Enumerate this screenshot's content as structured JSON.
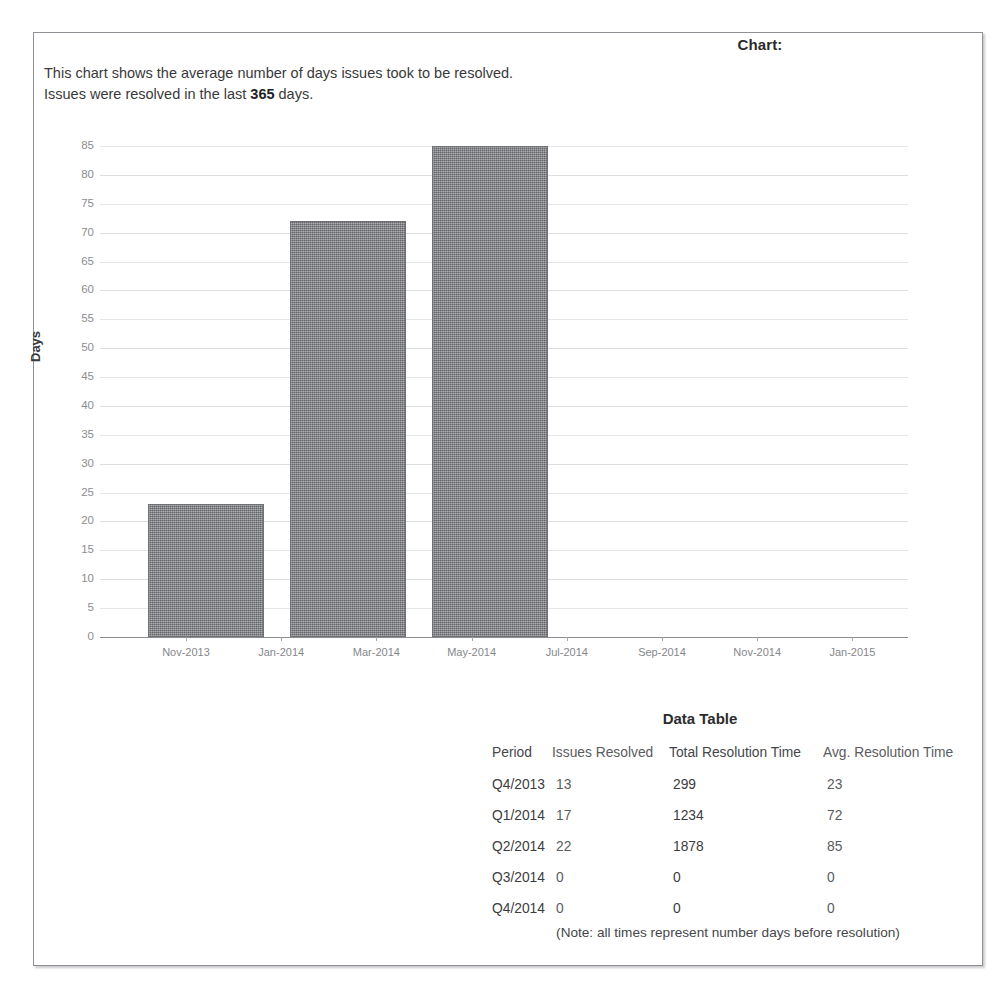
{
  "report": {
    "title": "Chart:",
    "intro_line1_before": "This chart shows the average number of days issues took to be resolved.",
    "intro_line2_a": "Issues were resolved in the last ",
    "intro_line2_bold": "365",
    "intro_line2_b": " days."
  },
  "chart_data": {
    "type": "bar",
    "title": "",
    "xlabel": "",
    "ylabel": "Days",
    "ylim": [
      0,
      85
    ],
    "ytick_step": 5,
    "yticks": [
      85,
      80,
      75,
      70,
      65,
      60,
      55,
      50,
      45,
      40,
      35,
      30,
      25,
      20,
      15,
      10,
      5,
      0
    ],
    "xtick_labels": [
      "Nov-2013",
      "Jan-2014",
      "Mar-2014",
      "May-2014",
      "Jul-2014",
      "Sep-2014",
      "Nov-2014",
      "Jan-2015"
    ],
    "grid": true,
    "legend": "none",
    "bar_color": "#7d7f82",
    "categories": [
      "Q4/2013",
      "Q1/2014",
      "Q2/2014",
      "Q3/2014",
      "Q4/2014"
    ],
    "values": [
      23,
      72,
      85,
      0,
      0
    ],
    "bars": [
      {
        "label": "Q4/2013",
        "value": 23
      },
      {
        "label": "Q1/2014",
        "value": 72
      },
      {
        "label": "Q2/2014",
        "value": 85
      }
    ]
  },
  "table": {
    "heading": "Data Table",
    "columns": [
      "Period",
      "Issues Resolved",
      "Total Resolution Time",
      "Avg. Resolution Time"
    ],
    "rows": [
      {
        "period": "Q4/2013",
        "issues_resolved": "13",
        "total_resolution_time": "299",
        "avg_resolution_time": "23"
      },
      {
        "period": "Q1/2014",
        "issues_resolved": "17",
        "total_resolution_time": "1234",
        "avg_resolution_time": "72"
      },
      {
        "period": "Q2/2014",
        "issues_resolved": "22",
        "total_resolution_time": "1878",
        "avg_resolution_time": "85"
      },
      {
        "period": "Q3/2014",
        "issues_resolved": "0",
        "total_resolution_time": "0",
        "avg_resolution_time": "0"
      },
      {
        "period": "Q4/2014",
        "issues_resolved": "0",
        "total_resolution_time": "0",
        "avg_resolution_time": "0"
      }
    ],
    "note": "(Note: all times represent number days before resolution)"
  }
}
